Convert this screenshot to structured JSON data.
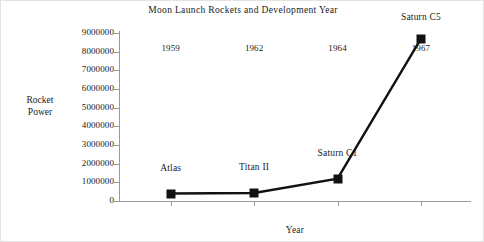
{
  "chart_data": {
    "type": "line",
    "title": "Moon Launch Rockets and Development Year",
    "xlabel": "Year",
    "ylabel": "Rocket Power",
    "ylabel_lines": [
      "Rocket",
      "Power"
    ],
    "categories": [
      "1959",
      "1962",
      "1964",
      "1967"
    ],
    "x": [
      1959,
      1962,
      1964,
      1967
    ],
    "values": [
      400000,
      430000,
      1200000,
      8700000
    ],
    "point_labels": [
      "Atlas",
      "Titan II",
      "Saturn C1",
      "Saturn C5"
    ],
    "ylim": [
      0,
      9000000
    ],
    "ytick_labels": [
      "9000000",
      "8000000",
      "7000000",
      "6000000",
      "5000000",
      "4000000",
      "3000000",
      "2000000",
      "1000000",
      "0"
    ],
    "ytick_values": [
      9000000,
      8000000,
      7000000,
      6000000,
      5000000,
      4000000,
      3000000,
      2000000,
      1000000,
      0
    ],
    "grid": false,
    "legend": false,
    "marker": "square",
    "series_color": "#121212",
    "axis_color": "#9a9a9a",
    "background_color": "#ffffff"
  }
}
